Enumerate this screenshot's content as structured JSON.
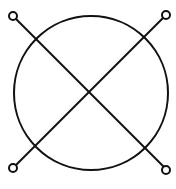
{
  "diagram": {
    "type": "circle-with-cross",
    "stroke_color": "#111111",
    "background": "#ffffff",
    "circle": {
      "cx": 91,
      "cy": 93,
      "r": 77
    },
    "lines": [
      {
        "from": [
          13,
          16
        ],
        "to": [
          166,
          169
        ]
      },
      {
        "from": [
          166,
          15
        ],
        "to": [
          13,
          168
        ]
      }
    ],
    "terminals": [
      {
        "cx": 13,
        "cy": 16,
        "r": 4
      },
      {
        "cx": 166,
        "cy": 15,
        "r": 4
      },
      {
        "cx": 13,
        "cy": 168,
        "r": 4
      },
      {
        "cx": 166,
        "cy": 170,
        "r": 4
      }
    ]
  }
}
